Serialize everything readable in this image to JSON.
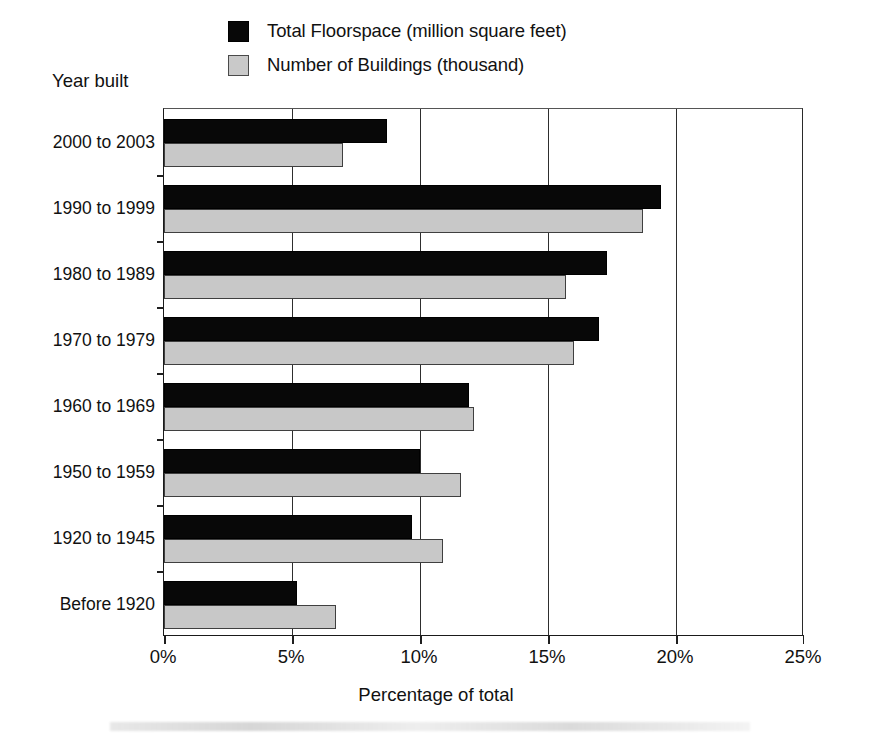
{
  "chart_data": {
    "type": "bar",
    "orientation": "horizontal",
    "title": "",
    "xlabel": "Percentage of total",
    "ylabel": "Year built",
    "xlim": [
      0,
      25
    ],
    "xtick_values": [
      0,
      5,
      10,
      15,
      20,
      25
    ],
    "xtick_labels": [
      "0%",
      "5%",
      "10%",
      "15%",
      "20%",
      "25%"
    ],
    "grid": "vertical",
    "legend_position": "top-right",
    "categories": [
      "2000 to 2003",
      "1990 to 1999",
      "1980 to 1989",
      "1970 to 1979",
      "1960 to 1969",
      "1950 to 1959",
      "1920 to 1945",
      "Before 1920"
    ],
    "series": [
      {
        "name": "Total Floorspace (million square feet)",
        "color": "#080808",
        "values": [
          8.7,
          19.4,
          17.3,
          17.0,
          11.9,
          10.0,
          9.7,
          5.2
        ]
      },
      {
        "name": "Number of Buildings (thousand)",
        "color": "#c8c8c8",
        "values": [
          7.0,
          18.7,
          15.7,
          16.0,
          12.1,
          11.6,
          10.9,
          6.7
        ]
      }
    ]
  },
  "legend": {
    "items": [
      {
        "label": "Total Floorspace (million square feet)",
        "swatch": "dark"
      },
      {
        "label": "Number of Buildings (thousand)",
        "swatch": "light"
      }
    ]
  },
  "axes": {
    "y_title": "Year built",
    "x_title": "Percentage of total"
  }
}
